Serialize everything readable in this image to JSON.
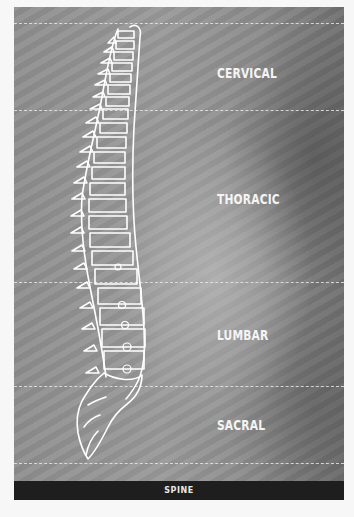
{
  "figure": {
    "title": "SPINE",
    "regions": [
      {
        "label": "CERVICAL"
      },
      {
        "label": "THORACIC"
      },
      {
        "label": "LUMBAR"
      },
      {
        "label": "SACRAL"
      }
    ],
    "colors": {
      "outline": "#ffffff",
      "footer_bg": "#1e1e1e",
      "label": "#f4f4f4",
      "dashed_line": "#e6e6e6"
    }
  }
}
